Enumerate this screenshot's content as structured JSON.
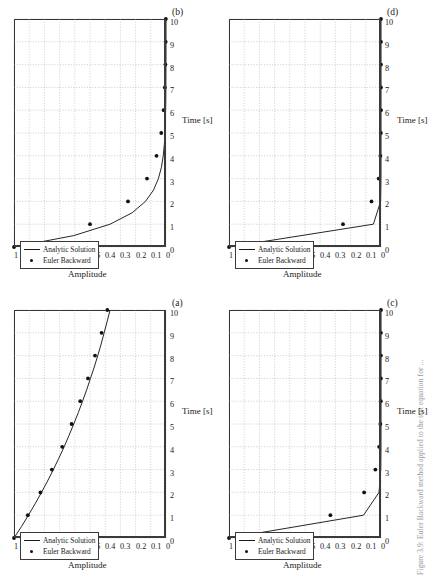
{
  "figure": {
    "rotation_note": "sideways",
    "axis": {
      "xlabel": "Time [s]",
      "ylabel": "Amplitude",
      "xticks": [
        "0",
        "1",
        "2",
        "3",
        "4",
        "5",
        "6",
        "7",
        "8",
        "9",
        "10"
      ],
      "yticks": [
        "0",
        "0.1",
        "0.2",
        "0.3",
        "0.4",
        "0.5",
        "0.6",
        "0.7",
        "0.8",
        "0.9",
        "1"
      ],
      "xlim": [
        0,
        10
      ],
      "ylim": [
        0,
        1
      ]
    },
    "legend": {
      "entries": [
        {
          "label": "Analytic Solution",
          "marker": "line"
        },
        {
          "label": "Euler Backward",
          "marker": "dot"
        }
      ]
    },
    "edge_caption": "Figure 3.9: Euler Backward method applied to the test equation for ..."
  },
  "chart_data": [
    {
      "type": "line",
      "id": "a",
      "panel_label": "(a)",
      "title": "",
      "xlabel": "Time [s]",
      "ylabel": "Amplitude",
      "xlim": [
        0,
        10
      ],
      "ylim": [
        0,
        1
      ],
      "grid": true,
      "legend_position": "top-left",
      "x": [
        0,
        1,
        2,
        3,
        4,
        5,
        6,
        7,
        8,
        9,
        10
      ],
      "series": [
        {
          "name": "Analytic Solution",
          "style": "line",
          "x": [
            0,
            0.5,
            1,
            1.5,
            2,
            2.5,
            3,
            3.5,
            4,
            4.5,
            5,
            5.5,
            6,
            6.5,
            7,
            7.5,
            8,
            8.5,
            9,
            9.5,
            10
          ],
          "values": [
            1,
            0.951,
            0.905,
            0.861,
            0.819,
            0.779,
            0.741,
            0.705,
            0.67,
            0.638,
            0.607,
            0.577,
            0.549,
            0.522,
            0.497,
            0.472,
            0.449,
            0.427,
            0.407,
            0.387,
            0.368
          ]
        },
        {
          "name": "Euler Backward",
          "style": "dots",
          "values": [
            1,
            0.909,
            0.826,
            0.751,
            0.683,
            0.621,
            0.564,
            0.513,
            0.467,
            0.424,
            0.386
          ]
        }
      ]
    },
    {
      "type": "line",
      "id": "b",
      "panel_label": "(b)",
      "title": "",
      "xlabel": "Time [s]",
      "ylabel": "Amplitude",
      "xlim": [
        0,
        10
      ],
      "ylim": [
        0,
        1
      ],
      "grid": true,
      "legend_position": "top-left",
      "x": [
        0,
        1,
        2,
        3,
        4,
        5,
        6,
        7,
        8,
        9,
        10
      ],
      "series": [
        {
          "name": "Analytic Solution",
          "style": "line",
          "x": [
            0,
            0.5,
            1,
            1.5,
            2,
            2.5,
            3,
            3.5,
            4,
            4.5,
            5,
            5.5,
            6,
            6.5,
            7,
            7.5,
            8,
            8.5,
            9,
            9.5,
            10
          ],
          "values": [
            1,
            0.607,
            0.368,
            0.223,
            0.135,
            0.082,
            0.05,
            0.03,
            0.018,
            0.011,
            0.0067,
            0.0041,
            0.0025,
            0.0015,
            0.0009,
            0.0006,
            0.0003,
            0.0002,
            0.0001,
            0.0001,
            0.0
          ]
        },
        {
          "name": "Euler Backward",
          "style": "dots",
          "values": [
            1,
            0.5,
            0.25,
            0.125,
            0.0625,
            0.03125,
            0.0156,
            0.0078,
            0.0039,
            0.00195,
            0.00098
          ]
        }
      ]
    },
    {
      "type": "line",
      "id": "c",
      "panel_label": "(c)",
      "title": "",
      "xlabel": "Time [s]",
      "ylabel": "Amplitude",
      "xlim": [
        0,
        10
      ],
      "ylim": [
        0,
        1
      ],
      "grid": true,
      "legend_position": "top-left",
      "x": [
        0,
        1,
        2,
        3,
        4,
        5,
        6,
        7,
        8,
        9,
        10
      ],
      "series": [
        {
          "name": "Analytic Solution",
          "style": "line",
          "x": [
            0,
            1,
            2,
            3,
            4,
            5,
            6,
            7,
            8,
            9,
            10
          ],
          "values": [
            1,
            0.115,
            0.013,
            0.0015,
            0.0002,
            0.0,
            0.0,
            0.0,
            0.0,
            0.0,
            0.0
          ]
        },
        {
          "name": "Euler Backward",
          "style": "dots",
          "values": [
            1,
            0.333,
            0.111,
            0.037,
            0.0123,
            0.0041,
            0.0014,
            0.0005,
            0.0002,
            0.0001,
            0.0
          ]
        }
      ]
    },
    {
      "type": "line",
      "id": "d",
      "panel_label": "(d)",
      "title": "",
      "xlabel": "Time [s]",
      "ylabel": "Amplitude",
      "xlim": [
        0,
        10
      ],
      "ylim": [
        0,
        1
      ],
      "grid": true,
      "legend_position": "top-left",
      "x": [
        0,
        1,
        2,
        3,
        4,
        5,
        6,
        7,
        8,
        9,
        10
      ],
      "series": [
        {
          "name": "Analytic Solution",
          "style": "line",
          "x": [
            0,
            1,
            2,
            3,
            4,
            5,
            6,
            7,
            8,
            9,
            10
          ],
          "values": [
            1,
            0.05,
            0.0025,
            0.0001,
            0.0,
            0.0,
            0.0,
            0.0,
            0.0,
            0.0,
            0.0
          ]
        },
        {
          "name": "Euler Backward",
          "style": "dots",
          "values": [
            1,
            0.25,
            0.0625,
            0.0156,
            0.0039,
            0.001,
            0.0002,
            0.0001,
            0.0,
            0.0,
            0.0
          ]
        }
      ]
    }
  ]
}
